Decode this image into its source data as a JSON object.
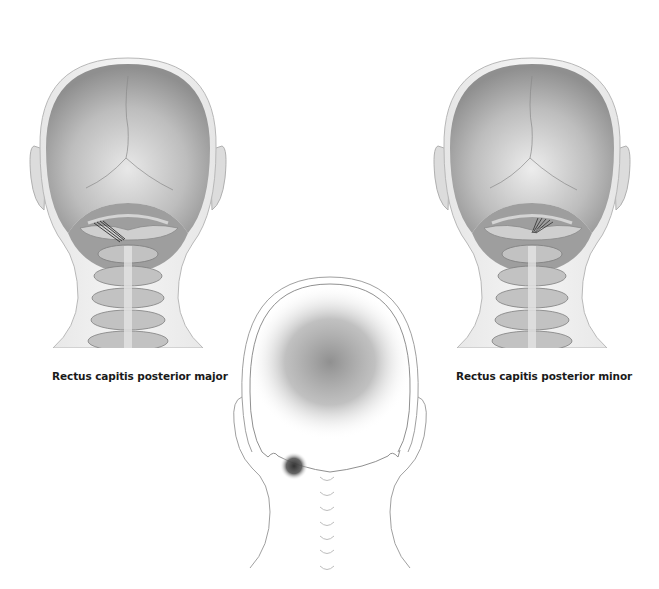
{
  "figures": {
    "left": {
      "label": "Rectus capitis posterior major",
      "view": "posterior head and cervical spine",
      "highlighted_muscle": "rectus capitis posterior major"
    },
    "right": {
      "label": "Rectus capitis posterior minor",
      "view": "posterior head and cervical spine",
      "highlighted_muscle": "rectus capitis posterior minor"
    },
    "center": {
      "view": "posterior head outline with pain referral",
      "referral_zone": "diffuse shading over back of head",
      "trigger_point": "suboccipital region, left of midline"
    }
  },
  "colors": {
    "background": "#ffffff",
    "skin_outline": "#9a9a9a",
    "skull": "#a8a8a8",
    "bone": "#8c8c8c",
    "referral": "#7a7a7a",
    "trigger_point": "#3c3c3c",
    "label_text": "#1a1a1a"
  }
}
